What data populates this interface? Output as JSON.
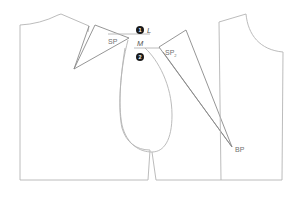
{
  "diagram": {
    "labels": {
      "sp": "SP",
      "sp2": "SP",
      "sp2_sub": "2",
      "bp": "BP",
      "l": "L",
      "m": "M",
      "step1": "1",
      "step2": "2"
    },
    "colors": {
      "outline": "#b4b4b4",
      "dart_lines": "#8a8a8a",
      "label_text": "#707070",
      "step_marker": "#1a1a1a"
    }
  }
}
